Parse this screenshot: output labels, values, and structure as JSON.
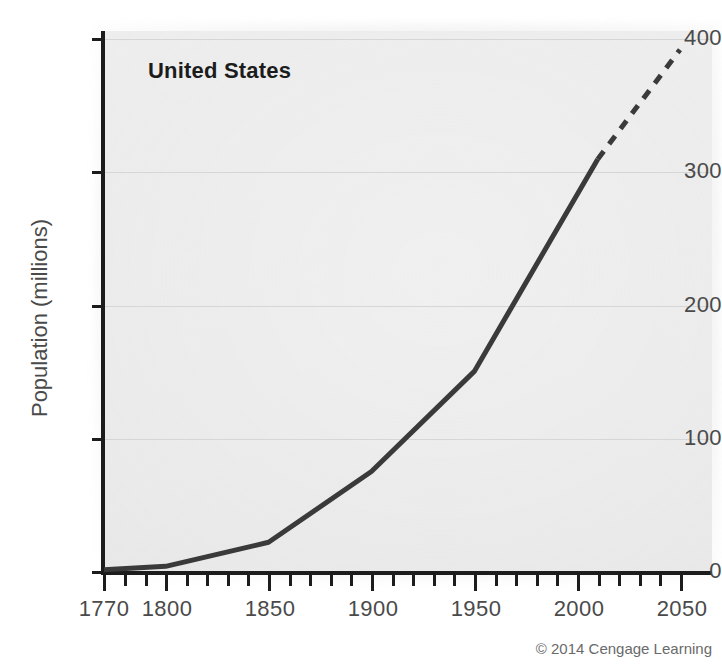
{
  "figure": {
    "series_title": "United States",
    "credit": "© 2014 Cengage Learning"
  },
  "chart_data": {
    "type": "line",
    "title": "United States",
    "xlabel": "",
    "ylabel": "Population (millions)",
    "xlim": [
      1770,
      2060
    ],
    "ylim": [
      0,
      400
    ],
    "grid": true,
    "legend": null,
    "x_ticks": [
      1770,
      1800,
      1850,
      1900,
      1950,
      2000,
      2050
    ],
    "x_tick_labels": [
      "1770",
      "1800",
      "1850",
      "1900",
      "1950",
      "2000",
      "2050"
    ],
    "x_minor_tick_interval": 10,
    "y_ticks": [
      0,
      100,
      200,
      300,
      400
    ],
    "y_tick_labels": [
      "0",
      "100",
      "200",
      "300",
      "400"
    ],
    "series": [
      {
        "name": "United States population (historical)",
        "style": "solid",
        "color": "#3a3a3a",
        "x": [
          1770,
          1800,
          1850,
          1900,
          1950,
          2010
        ],
        "values": [
          2.5,
          5,
          23,
          76,
          151,
          310
        ]
      },
      {
        "name": "United States population (projected)",
        "style": "dashed",
        "color": "#3a3a3a",
        "x": [
          2010,
          2050
        ],
        "values": [
          310,
          392
        ]
      }
    ],
    "annotations": [
      {
        "text": "United States",
        "x": 1791,
        "y": 385,
        "bold": true
      }
    ]
  },
  "axes": {
    "y_label": "Population (millions)",
    "y_ticks": [
      {
        "label": "400",
        "value": 400
      },
      {
        "label": "300",
        "value": 300
      },
      {
        "label": "200",
        "value": 200
      },
      {
        "label": "100",
        "value": 100
      },
      {
        "label": "0",
        "value": 0
      }
    ],
    "x_ticks": [
      {
        "label": "1770",
        "value": 1770
      },
      {
        "label": "1800",
        "value": 1800
      },
      {
        "label": "1850",
        "value": 1850
      },
      {
        "label": "1900",
        "value": 1900
      },
      {
        "label": "1950",
        "value": 1950
      },
      {
        "label": "2000",
        "value": 2000
      },
      {
        "label": "2050",
        "value": 2050
      }
    ]
  },
  "colors": {
    "line": "#3a3a3a",
    "axis": "#1c1c1c",
    "grid": "#d6d6d6",
    "plot_background": "#ececec",
    "tick_text": "#4a4a4a",
    "title_text": "#1c1c1c",
    "credit_text": "#6a6a6a"
  }
}
